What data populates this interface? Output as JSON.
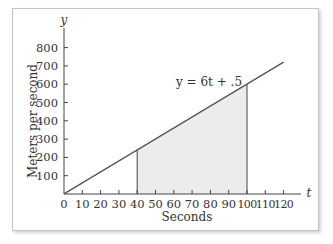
{
  "chart_data": {
    "type": "line",
    "title": "",
    "xlabel": "Seconds",
    "ylabel": "Meters per second",
    "x_axis_var": "t",
    "y_axis_var": "y",
    "xlim": [
      0,
      120
    ],
    "ylim": [
      0,
      800
    ],
    "x_ticks": [
      0,
      10,
      20,
      30,
      40,
      50,
      60,
      70,
      80,
      90,
      100,
      110,
      120
    ],
    "y_ticks": [
      100,
      200,
      300,
      400,
      500,
      600,
      700,
      800
    ],
    "x_tick_labels": [
      "0",
      "10",
      "20",
      "30",
      "40",
      "50",
      "60",
      "70",
      "80",
      "90",
      "100",
      "110",
      "120"
    ],
    "y_tick_labels": [
      "100",
      "200",
      "300",
      "400",
      "500",
      "600",
      "700",
      "800"
    ],
    "grid": false,
    "legend": null,
    "series": [
      {
        "name": "y = 6t + .5",
        "equation": "y = 6t + .5",
        "x": [
          0,
          120
        ],
        "y": [
          0.5,
          720.5
        ]
      }
    ],
    "shaded_region": {
      "x_start": 40,
      "x_end": 100,
      "y_at_start": 240.5,
      "y_at_end": 600.5,
      "color": "#ececec"
    },
    "annotations": [
      {
        "text": "y = 6t + .5",
        "x": 80,
        "y": 640
      }
    ]
  },
  "labels": {
    "x_axis_title": "Seconds",
    "y_axis_title": "Meters per second",
    "x_var": "t",
    "y_var": "y",
    "equation": "y = 6t + .5"
  },
  "colors": {
    "line": "#555555",
    "axis": "#444444",
    "fill": "#ececec",
    "frame_border": "#c4c4c4"
  }
}
